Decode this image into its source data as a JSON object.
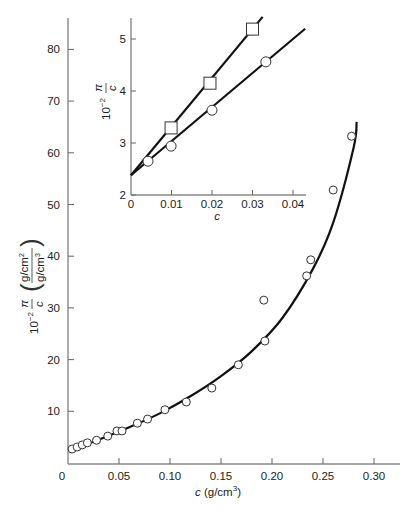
{
  "chart_data": [
    {
      "name": "main",
      "type": "scatter",
      "title": "",
      "xlabel": "c (g/cm³)",
      "ylabel": "10⁻² π/c ((g/cm²)/(g/cm³))",
      "xlabel_parts": {
        "var": "c",
        "unit": " (g/cm",
        "sup": "3",
        "close": ")"
      },
      "ylabel_parts": {
        "prefix": "10",
        "exp": "−2",
        "num": "π",
        "den": "c",
        "unit_num": "g/cm",
        "unit_num_sup": "2",
        "unit_den": "g/cm",
        "unit_den_sup": "3"
      },
      "xlim": [
        0,
        0.33
      ],
      "ylim": [
        0,
        86
      ],
      "xticks": [
        0,
        0.05,
        0.1,
        0.15,
        0.2,
        0.25,
        0.3
      ],
      "xtick_labels": [
        "0",
        "0.05",
        "0.10",
        "0.15",
        "0.20",
        "0.25",
        "0.30"
      ],
      "yticks": [
        10,
        20,
        30,
        40,
        50,
        60,
        70,
        80
      ],
      "ytick_labels": [
        "10",
        "20",
        "30",
        "40",
        "50",
        "60",
        "70",
        "80"
      ],
      "grid": false,
      "series": [
        {
          "name": "data",
          "marker": "circle",
          "x": [
            0.004,
            0.009,
            0.014,
            0.019,
            0.028,
            0.039,
            0.048,
            0.053,
            0.068,
            0.078,
            0.095,
            0.116,
            0.141,
            0.167,
            0.193,
            0.192,
            0.234,
            0.238,
            0.26,
            0.278
          ],
          "y": [
            2.7,
            3.1,
            3.5,
            3.9,
            4.4,
            5.2,
            6.2,
            6.2,
            7.7,
            8.5,
            10.3,
            11.8,
            14.5,
            19.0,
            23.6,
            31.5,
            36.2,
            39.3,
            52.8,
            63.2
          ]
        },
        {
          "name": "fit",
          "marker": "line",
          "x": [
            0.004,
            0.03,
            0.06,
            0.09,
            0.12,
            0.15,
            0.18,
            0.21,
            0.24,
            0.26,
            0.28,
            0.283
          ],
          "y": [
            2.6,
            4.5,
            6.9,
            9.6,
            12.9,
            16.8,
            21.6,
            28.0,
            37.5,
            46.5,
            61.0,
            66.0
          ]
        }
      ]
    },
    {
      "name": "inset",
      "type": "line",
      "title": "",
      "xlabel": "c",
      "ylabel": "10⁻² π/c",
      "xlim": [
        0,
        0.043
      ],
      "ylim": [
        2,
        5.4
      ],
      "xticks": [
        0,
        0.01,
        0.02,
        0.03,
        0.04
      ],
      "xtick_labels": [
        "0",
        "0.01",
        "0.02",
        "0.03",
        "0.04"
      ],
      "yticks": [
        2,
        3,
        4,
        5
      ],
      "ytick_labels": [
        "2",
        "3",
        "4",
        "5"
      ],
      "grid": false,
      "series": [
        {
          "name": "squares",
          "marker": "square",
          "x": [
            0.0099,
            0.0195,
            0.03
          ],
          "y": [
            3.29,
            4.15,
            5.19
          ],
          "fit": {
            "intercept": 2.38,
            "slope": 93.7,
            "x_end": 0.0325
          }
        },
        {
          "name": "circles",
          "marker": "circle",
          "x": [
            0.0042,
            0.0099,
            0.02,
            0.0333
          ],
          "y": [
            2.65,
            2.94,
            3.63,
            4.56
          ],
          "fit": {
            "intercept": 2.38,
            "slope": 65.5,
            "x_end": 0.043
          }
        }
      ]
    }
  ]
}
